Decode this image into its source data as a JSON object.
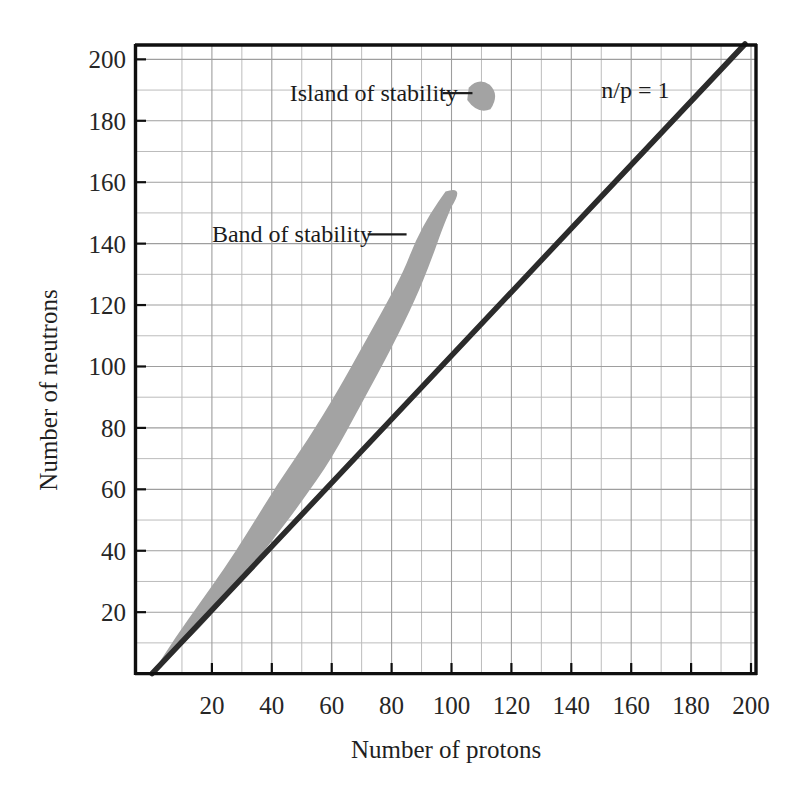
{
  "figure": {
    "caption_title": "",
    "background_color": "#ffffff"
  },
  "chart_data": {
    "type": "area",
    "title": "",
    "xlabel": "Number of protons",
    "ylabel": "Number of neutrons",
    "xlim": [
      0,
      202
    ],
    "ylim": [
      0,
      205
    ],
    "grid": true,
    "grid_minor_step": 10,
    "legend_position": "none",
    "x_ticks": [
      20,
      40,
      60,
      80,
      100,
      120,
      140,
      160,
      180,
      200
    ],
    "x_tick_labels": [
      "20",
      "40",
      "60",
      "80",
      "100",
      "120",
      "140",
      "160",
      "180",
      "200"
    ],
    "y_ticks": [
      20,
      40,
      60,
      80,
      100,
      120,
      140,
      160,
      180,
      200
    ],
    "y_tick_labels": [
      "20",
      "40",
      "60",
      "80",
      "100",
      "120",
      "140",
      "160",
      "180",
      "200"
    ],
    "series": [
      {
        "name": "Band of stability",
        "kind": "band",
        "color": "#a3a3a3",
        "lower_bound": [
          [
            0,
            0
          ],
          [
            10,
            9
          ],
          [
            20,
            19
          ],
          [
            30,
            31
          ],
          [
            40,
            43
          ],
          [
            50,
            56
          ],
          [
            60,
            70
          ],
          [
            70,
            88
          ],
          [
            80,
            106
          ],
          [
            88,
            122
          ],
          [
            93,
            134
          ],
          [
            97,
            145
          ],
          [
            100,
            152
          ]
        ],
        "upper_bound": [
          [
            0,
            0
          ],
          [
            8,
            12
          ],
          [
            16,
            23
          ],
          [
            24,
            34
          ],
          [
            32,
            46
          ],
          [
            42,
            62
          ],
          [
            52,
            76
          ],
          [
            62,
            92
          ],
          [
            70,
            106
          ],
          [
            78,
            120
          ],
          [
            84,
            131
          ],
          [
            88,
            141
          ],
          [
            93,
            150
          ],
          [
            98,
            157
          ]
        ]
      },
      {
        "name": "n/p = 1",
        "kind": "line",
        "color": "#2b2b2b",
        "points": [
          [
            0,
            0
          ],
          [
            198,
            205
          ]
        ]
      },
      {
        "name": "Island of stability",
        "kind": "blob",
        "color": "#a3a3a3",
        "center": [
          110,
          188
        ],
        "radius_x": 5,
        "radius_y": 5
      }
    ],
    "annotations": [
      {
        "id": "island-of-stability",
        "text": "Island of stability",
        "text_x": 46,
        "text_y": 189,
        "leader_from": [
          97,
          189
        ],
        "leader_to": [
          107,
          189
        ]
      },
      {
        "id": "band-of-stability",
        "text": "Band of stability",
        "text_x": 20,
        "text_y": 143,
        "leader_from": [
          72,
          143
        ],
        "leader_to": [
          85,
          143
        ]
      },
      {
        "id": "np-ratio",
        "text": "n/p = 1",
        "text_x": 150,
        "text_y": 190,
        "leader_from": null,
        "leader_to": null
      }
    ]
  },
  "colors": {
    "band": "#a3a3a3",
    "line": "#2b2b2b",
    "axis": "#111111",
    "grid_minor": "#b9b9b9",
    "grid_major": "#9a9a9a",
    "text": "#1a1a1a"
  }
}
